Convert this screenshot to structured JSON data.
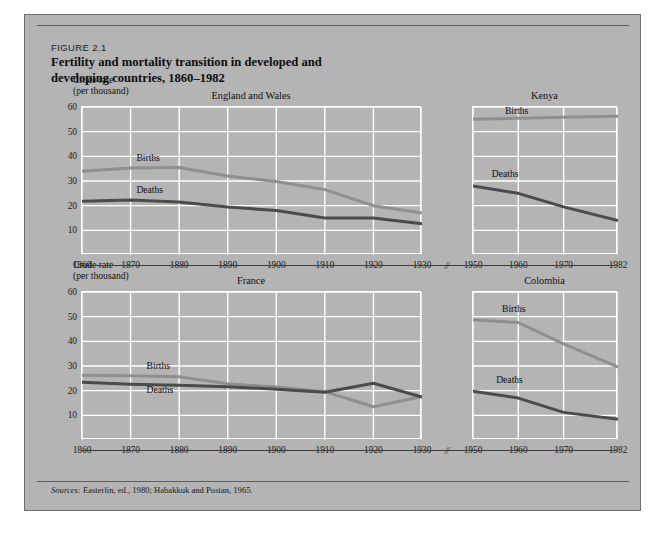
{
  "figure": {
    "number": "FIGURE 2.1",
    "title_line1": "Fertility and mortality transition in developed and",
    "title_line2": "developing countries, 1860–1982",
    "axis_caption_line1": "Crude rate",
    "axis_caption_line2": "(per thousand)",
    "source_prefix": "Sources:",
    "source_text": "Easterlin, ed., 1980; Habakkuk and Postan, 1965.",
    "axis_break_mark": "//"
  },
  "colors": {
    "panel_background": "#b4b4b4",
    "gridline": "#ffffff",
    "births_line": "#8f8f8f",
    "deaths_line": "#4b4b4b",
    "axis_rule": "#3a3a3a",
    "text": "#111111",
    "border": "#6e6e6e"
  },
  "chart_data": [
    {
      "type": "line",
      "title": "England and Wales",
      "xlabel": "",
      "ylabel": "Crude rate (per thousand)",
      "ylim": [
        0,
        60
      ],
      "yticks": [
        10,
        20,
        30,
        40,
        50,
        60
      ],
      "xlim": [
        1860,
        1930
      ],
      "xticks": [
        1860,
        1870,
        1880,
        1890,
        1900,
        1910,
        1920,
        1930
      ],
      "x": [
        1860,
        1870,
        1880,
        1890,
        1900,
        1910,
        1920,
        1930
      ],
      "grid": true,
      "legend_position": "inline-labels",
      "series": [
        {
          "name": "Births",
          "values": [
            34.0,
            35.3,
            35.5,
            32.0,
            29.8,
            26.5,
            20.0,
            17.0
          ]
        },
        {
          "name": "Deaths",
          "values": [
            21.8,
            22.3,
            21.5,
            19.5,
            18.0,
            15.0,
            15.0,
            12.7
          ]
        }
      ]
    },
    {
      "type": "line",
      "title": "Kenya",
      "xlabel": "",
      "ylabel": "Crude rate (per thousand)",
      "ylim": [
        0,
        60
      ],
      "yticks": [
        10,
        20,
        30,
        40,
        50,
        60
      ],
      "xlim": [
        1950,
        1982
      ],
      "xticks": [
        1950,
        1960,
        1970,
        1982
      ],
      "x": [
        1950,
        1960,
        1970,
        1982
      ],
      "grid": true,
      "legend_position": "inline-labels",
      "series": [
        {
          "name": "Births",
          "values": [
            55.0,
            55.4,
            55.8,
            56.2
          ]
        },
        {
          "name": "Deaths",
          "values": [
            28.0,
            25.0,
            19.5,
            14.0
          ]
        }
      ]
    },
    {
      "type": "line",
      "title": "France",
      "xlabel": "",
      "ylabel": "Crude rate (per thousand)",
      "ylim": [
        0,
        60
      ],
      "yticks": [
        10,
        20,
        30,
        40,
        50,
        60
      ],
      "xlim": [
        1860,
        1930
      ],
      "xticks": [
        1860,
        1870,
        1880,
        1890,
        1900,
        1910,
        1920,
        1930
      ],
      "x": [
        1860,
        1870,
        1880,
        1890,
        1900,
        1910,
        1920,
        1930
      ],
      "grid": true,
      "legend_position": "inline-labels",
      "series": [
        {
          "name": "Births",
          "values": [
            26.2,
            26.0,
            25.6,
            22.8,
            21.5,
            19.6,
            13.5,
            17.6
          ]
        },
        {
          "name": "Deaths",
          "values": [
            23.4,
            22.6,
            22.2,
            21.6,
            20.6,
            19.4,
            23.0,
            17.4
          ]
        }
      ]
    },
    {
      "type": "line",
      "title": "Colombia",
      "xlabel": "",
      "ylabel": "Crude rate (per thousand)",
      "ylim": [
        0,
        60
      ],
      "yticks": [
        10,
        20,
        30,
        40,
        50,
        60
      ],
      "xlim": [
        1950,
        1982
      ],
      "xticks": [
        1950,
        1960,
        1970,
        1982
      ],
      "x": [
        1950,
        1960,
        1970,
        1982
      ],
      "grid": true,
      "legend_position": "inline-labels",
      "series": [
        {
          "name": "Births",
          "values": [
            48.8,
            47.6,
            39.0,
            29.5
          ]
        },
        {
          "name": "Deaths",
          "values": [
            19.8,
            17.0,
            11.2,
            8.4
          ]
        }
      ]
    }
  ]
}
